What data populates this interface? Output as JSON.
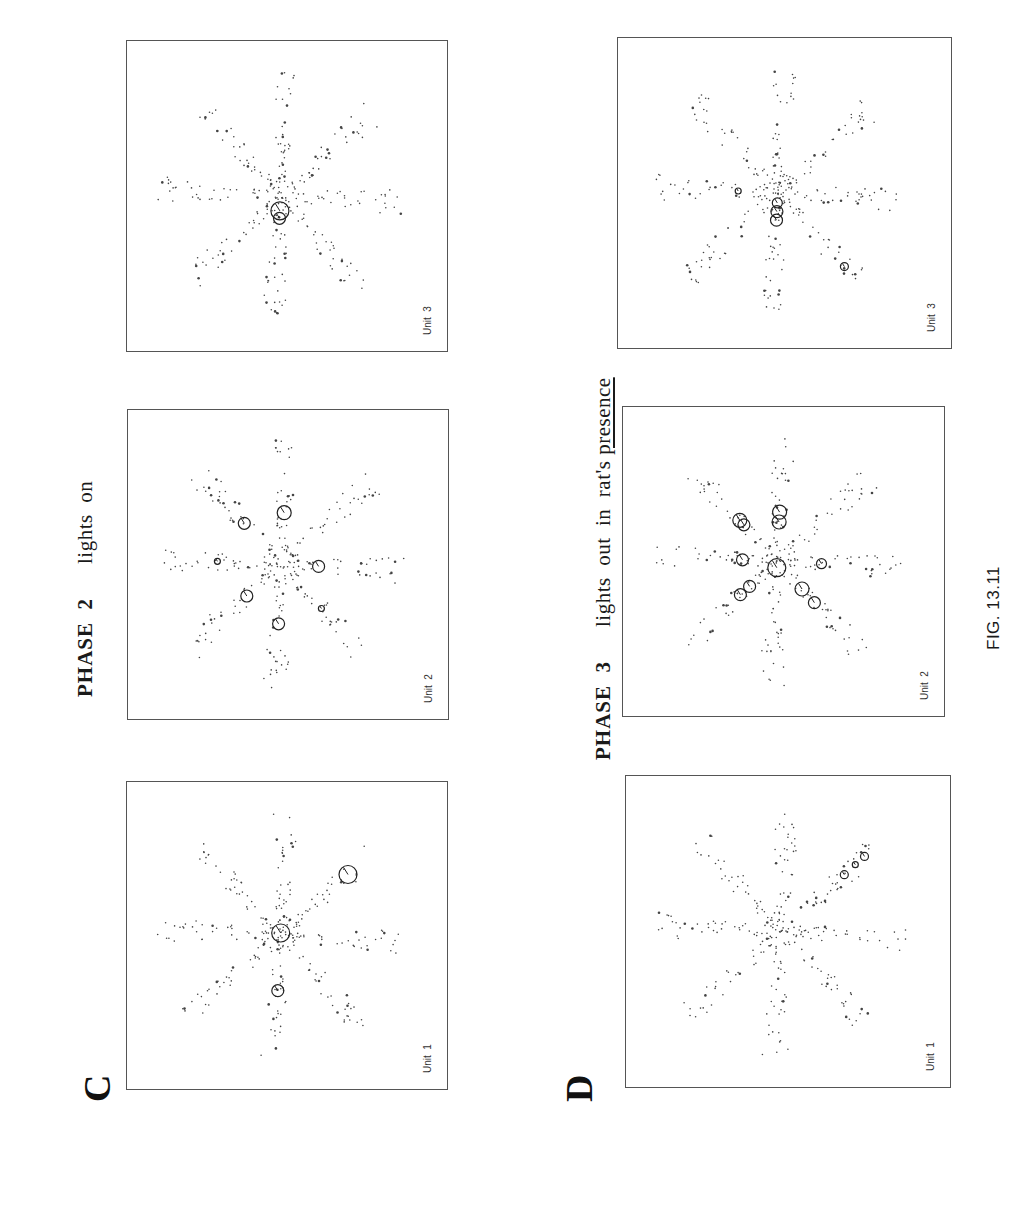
{
  "figure": {
    "caption": "FIG. 13.11",
    "colors": {
      "ink": "#1a1a1a",
      "frame": "#555555",
      "dots": "#444444",
      "background": "#ffffff"
    }
  },
  "section_c": {
    "label": "C",
    "phase": "PHASE  2",
    "condition": "lights  on",
    "panels": [
      {
        "unit": "Unit  1",
        "firing_fields": [
          {
            "arm": 0,
            "r": 0.02,
            "size": 9
          },
          {
            "arm": 1,
            "r": 0.74,
            "size": 9
          },
          {
            "arm": 4,
            "r": 0.45,
            "size": 6
          }
        ]
      },
      {
        "unit": "Unit  2",
        "firing_fields": [
          {
            "arm": 2,
            "r": 0.3,
            "size": 6
          },
          {
            "arm": 0,
            "r": 0.42,
            "size": 7
          },
          {
            "arm": 4,
            "r": 0.48,
            "size": 6
          },
          {
            "arm": 5,
            "r": 0.38,
            "size": 6
          },
          {
            "arm": 7,
            "r": 0.45,
            "size": 6
          },
          {
            "arm": 6,
            "r": 0.52,
            "size": 3
          },
          {
            "arm": 3,
            "r": 0.48,
            "size": 3
          }
        ]
      },
      {
        "unit": "Unit  3",
        "firing_fields": [
          {
            "arm": 4,
            "r": 0.12,
            "size": 9
          },
          {
            "arm": 4,
            "r": 0.18,
            "size": 6
          }
        ]
      }
    ]
  },
  "section_d": {
    "label": "D",
    "phase": "PHASE  3",
    "condition_prefix": "lights  out  in  rat's ",
    "condition_emphasis": "presence",
    "panels": [
      {
        "unit": "Unit  1",
        "firing_fields": [
          {
            "arm": 1,
            "r": 0.68,
            "size": 4
          },
          {
            "arm": 1,
            "r": 0.8,
            "size": 3
          },
          {
            "arm": 1,
            "r": 0.9,
            "size": 4
          }
        ]
      },
      {
        "unit": "Unit  2",
        "firing_fields": [
          {
            "arm": 4,
            "r": 0.05,
            "size": 9
          },
          {
            "arm": 0,
            "r": 0.32,
            "size": 7
          },
          {
            "arm": 0,
            "r": 0.4,
            "size": 7
          },
          {
            "arm": 5,
            "r": 0.3,
            "size": 6
          },
          {
            "arm": 5,
            "r": 0.4,
            "size": 6
          },
          {
            "arm": 3,
            "r": 0.3,
            "size": 7
          },
          {
            "arm": 3,
            "r": 0.45,
            "size": 6
          },
          {
            "arm": 6,
            "r": 0.28,
            "size": 6
          },
          {
            "arm": 7,
            "r": 0.4,
            "size": 6
          },
          {
            "arm": 7,
            "r": 0.45,
            "size": 7
          },
          {
            "arm": 2,
            "r": 0.36,
            "size": 5
          }
        ]
      },
      {
        "unit": "Unit  3",
        "firing_fields": [
          {
            "arm": 4,
            "r": 0.15,
            "size": 6
          },
          {
            "arm": 4,
            "r": 0.22,
            "size": 6
          },
          {
            "arm": 4,
            "r": 0.08,
            "size": 5
          },
          {
            "arm": 3,
            "r": 0.8,
            "size": 4
          },
          {
            "arm": 6,
            "r": 0.32,
            "size": 3
          }
        ]
      }
    ]
  },
  "chart_data": [
    {
      "type": "scatter",
      "title": "C — PHASE 2 lights on",
      "description": "Spatial firing maps of hippocampal units on an 8-arm radial maze; small dots = rat position samples along arms, open circles = spike firing locations (circle size ~ firing rate).",
      "panels": [
        "Unit 1",
        "Unit 2",
        "Unit 3"
      ],
      "arms": 8,
      "xlabel": "",
      "ylabel": "",
      "grid": false,
      "legend": null
    },
    {
      "type": "scatter",
      "title": "D — PHASE 3 lights out in rat's presence",
      "description": "Same units recorded after lights were turned out with the rat present; firing fields shift/cluster near the maze center for Units 2 and 3, Unit 1 field along one arm end.",
      "panels": [
        "Unit 1",
        "Unit 2",
        "Unit 3"
      ],
      "arms": 8,
      "xlabel": "",
      "ylabel": "",
      "grid": false,
      "legend": null
    }
  ]
}
